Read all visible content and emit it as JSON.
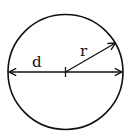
{
  "diagram": {
    "type": "geometry",
    "labels": {
      "diameter": "d",
      "radius": "r"
    },
    "colors": {
      "stroke": "#111111",
      "background": "#ffffff"
    },
    "geometry": {
      "center": [
        65.5,
        72
      ],
      "radius": 57.5,
      "radius_endpoint": [
        116,
        43
      ]
    }
  }
}
